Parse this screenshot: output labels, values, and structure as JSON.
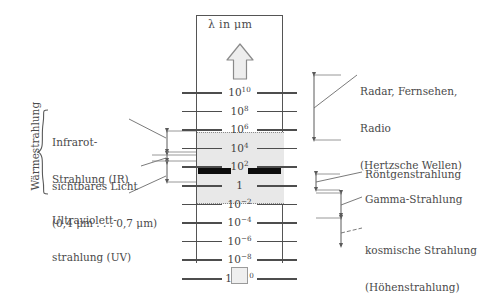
{
  "figure": {
    "background_color": "#ffffff",
    "axis_caption": "λ in μm",
    "arrow_direction": "up",
    "band_color": "#e8e8e8",
    "visible_bar_color": "#0c0c0c"
  },
  "scale": {
    "ticks": [
      {
        "mantissa": "10",
        "exponent": "10",
        "value": 10000000000
      },
      {
        "mantissa": "10",
        "exponent": "8",
        "value": 100000000
      },
      {
        "mantissa": "10",
        "exponent": "6",
        "value": 1000000
      },
      {
        "mantissa": "10",
        "exponent": "4",
        "value": 10000
      },
      {
        "mantissa": "10",
        "exponent": "2",
        "value": 100
      },
      {
        "mantissa": "1",
        "exponent": "",
        "value": 1
      },
      {
        "mantissa": "10",
        "exponent": "−2",
        "value": 0.01
      },
      {
        "mantissa": "10",
        "exponent": "−4",
        "value": 0.0001
      },
      {
        "mantissa": "10",
        "exponent": "−6",
        "value": 1e-06
      },
      {
        "mantissa": "10",
        "exponent": "−8",
        "value": 1e-08
      },
      {
        "mantissa": "10",
        "exponent": "−10",
        "value": 1e-10
      }
    ]
  },
  "left_labels": {
    "thermal_group": "Wärmestrahlung",
    "infrared": [
      "Infrarot-",
      "Strahlung (IR)"
    ],
    "visible": [
      "sichtbares Licht",
      "(0,4 μm . . . 0,7 μm)"
    ],
    "ultraviolet": [
      "Ultraviolett-",
      "strahlung (UV)"
    ]
  },
  "right_labels": {
    "radio": [
      "Radar, Fernsehen,",
      "Radio",
      "(Hertzsche Wellen)"
    ],
    "xray": [
      "Röntgenstrahlung"
    ],
    "gamma": [
      "Gamma-Strahlung"
    ],
    "cosmic": [
      "kosmische Strahlung",
      "(Höhenstrahlung)"
    ]
  },
  "chart_data": {
    "type": "bar",
    "xlabel": "",
    "ylabel": "λ in μm",
    "orientation": "vertical-log",
    "categories": [
      "Radar, Fernsehen, Radio (Hertzsche Wellen)",
      "Infrarot-Strahlung (IR)",
      "sichtbares Licht",
      "Ultraviolett-Strahlung (UV)",
      "Röntgenstrahlung",
      "Gamma-Strahlung",
      "kosmische Strahlung (Höhenstrahlung)"
    ],
    "values": [
      {
        "name": "Radar, Fernsehen, Radio (Hertzsche Wellen)",
        "lambda_max_um": 10000000000,
        "lambda_min_um": 10000
      },
      {
        "name": "Infrarot-Strahlung (IR)",
        "lambda_max_um": 1000,
        "lambda_min_um": 0.7
      },
      {
        "name": "sichtbares Licht",
        "lambda_max_um": 0.7,
        "lambda_min_um": 0.4
      },
      {
        "name": "Ultraviolett-Strahlung (UV)",
        "lambda_max_um": 0.4,
        "lambda_min_um": 0.01
      },
      {
        "name": "Röntgenstrahlung",
        "lambda_max_um": 0.01,
        "lambda_min_um": 0.0001
      },
      {
        "name": "Gamma-Strahlung",
        "lambda_max_um": 0.0001,
        "lambda_min_um": 1e-08
      },
      {
        "name": "kosmische Strahlung (Höhenstrahlung)",
        "lambda_max_um": 1e-06,
        "lambda_min_um": 1e-10
      }
    ],
    "ylim": [
      1e-10,
      10000000000.0
    ],
    "ytick_labels": [
      "10^10",
      "10^8",
      "10^6",
      "10^4",
      "10^2",
      "1",
      "10^-2",
      "10^-4",
      "10^-6",
      "10^-8",
      "10^-10"
    ],
    "grid": false,
    "legend": "none",
    "annotations": [
      "Wärmestrahlung umfasst IR, sichtbares Licht und UV"
    ]
  }
}
